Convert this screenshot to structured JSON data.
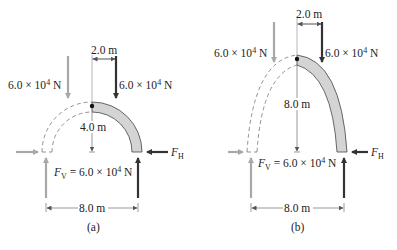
{
  "figures": [
    {
      "id": "a",
      "caption": "(a)",
      "load_left_label": "6.0 × 10",
      "load_left_exp": "4",
      "load_left_unit": " N",
      "load_right_label": "6.0 × 10",
      "load_right_exp": "4",
      "load_right_unit": " N",
      "offset_dim": "2.0 m",
      "height_dim": "4.0 m",
      "span_dim": "8.0 m",
      "fv_symbol": "F",
      "fv_sub": "V",
      "fv_value": " = 6.0 × 10",
      "fv_exp": "4",
      "fv_unit": " N",
      "fh_symbol": "F",
      "fh_sub": "H",
      "shape": "semicircular arch"
    },
    {
      "id": "b",
      "caption": "(b)",
      "load_left_label": "6.0 × 10",
      "load_left_exp": "4",
      "load_left_unit": " N",
      "load_right_label": "6.0 × 10",
      "load_right_exp": "4",
      "load_right_unit": " N",
      "offset_dim": "2.0 m",
      "height_dim": "8.0 m",
      "span_dim": "8.0 m",
      "fv_symbol": "F",
      "fv_sub": "V",
      "fv_value": " = 6.0 × 10",
      "fv_exp": "4",
      "fv_unit": " N",
      "fh_symbol": "F",
      "fh_sub": "H",
      "shape": "parabolic (pointed) arch"
    }
  ],
  "colors": {
    "arch_fill": "#d4d4d4",
    "dark_arrow": "#333333",
    "light_arrow": "#a8a8a8",
    "dashed": "#777777",
    "dim_line": "#555555"
  }
}
